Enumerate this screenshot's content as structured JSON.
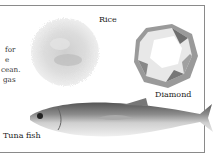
{
  "figure": {
    "side_text_lines": [
      "for",
      "e",
      "cean.",
      "gas"
    ],
    "labels": {
      "rice": "Rice",
      "diamond": "Diamond",
      "tuna": "Tuna fish"
    },
    "images": {
      "rice": "rice-pile-image",
      "diamond": "diamond-image",
      "tuna": "tuna-fish-image"
    },
    "colors": {
      "border": "#8a8a8a",
      "text": "#222222",
      "background": "#ffffff"
    }
  }
}
